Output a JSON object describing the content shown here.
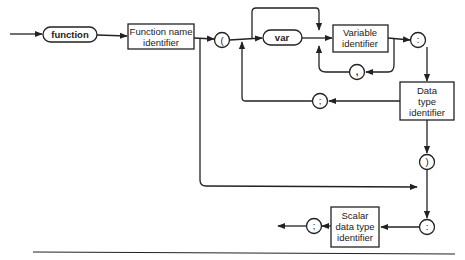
{
  "diagram": {
    "type": "syntax-diagram",
    "nodes": {
      "function_kw": "function",
      "function_name": [
        "Function name",
        "identifier"
      ],
      "open_paren": "(",
      "var_kw": "var",
      "variable_id": [
        "Variable",
        "identifier"
      ],
      "comma": ",",
      "colon1": ":",
      "data_type": [
        "Data",
        "type",
        "identifier"
      ],
      "semicolon1": ";",
      "close_paren": ")",
      "colon2": ":",
      "scalar_type": [
        "Scalar",
        "data type",
        "identifier"
      ],
      "semicolon_end": ";"
    },
    "colors": {
      "line": "#222222",
      "background": "#ffffff"
    }
  }
}
